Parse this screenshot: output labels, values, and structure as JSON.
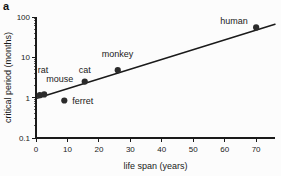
{
  "panel": {
    "label": "a"
  },
  "chart_data": {
    "type": "scatter",
    "title": "",
    "xlabel": "life span (years)",
    "ylabel": "critical period (months)",
    "xscale": "linear",
    "yscale": "log",
    "xlim": [
      0,
      76
    ],
    "ylim": [
      0.1,
      100
    ],
    "xticks": [
      0,
      10,
      20,
      30,
      40,
      50,
      60,
      70
    ],
    "xtick_labels": [
      "0",
      "10",
      "20",
      "30",
      "40",
      "50",
      "60",
      "70"
    ],
    "yticks": [
      0.1,
      1,
      10,
      100
    ],
    "ytick_labels": [
      "0.1",
      "1",
      "10",
      "100"
    ],
    "grid": false,
    "legend": "none",
    "points": [
      {
        "name": "rat",
        "x": 1.2,
        "y": 1.15,
        "label": "rat",
        "label_dx": -2,
        "label_dy": -22
      },
      {
        "name": "mouse",
        "x": 2.6,
        "y": 1.2,
        "label": "mouse",
        "label_dx": 2,
        "label_dy": -12
      },
      {
        "name": "ferret",
        "x": 9.0,
        "y": 0.85,
        "label": "ferret",
        "label_dx": 8,
        "label_dy": 3
      },
      {
        "name": "cat",
        "x": 15.5,
        "y": 2.5,
        "label": "cat",
        "label_dx": -6,
        "label_dy": -9
      },
      {
        "name": "monkey",
        "x": 26.0,
        "y": 4.8,
        "label": "monkey",
        "label_dx": -16,
        "label_dy": -13
      },
      {
        "name": "human",
        "x": 70.0,
        "y": 55.0,
        "label": "human",
        "label_dx": -36,
        "label_dy": -3
      }
    ],
    "fit_line": {
      "description": "linear regression on semi-log axes",
      "x_start": 0.0,
      "y_start": 0.95,
      "x_end": 76.0,
      "y_end": 66.0
    },
    "minor_ticks_y": [
      0.2,
      0.3,
      0.4,
      0.5,
      0.6,
      0.7,
      0.8,
      0.9,
      2,
      3,
      4,
      5,
      6,
      7,
      8,
      9,
      20,
      30,
      40,
      50,
      60,
      70,
      80,
      90
    ]
  },
  "colors": {
    "background": "#fcfcfc",
    "axis": "#1a1a1a",
    "point": "#2b2b2b",
    "line": "#1a1a1a"
  }
}
